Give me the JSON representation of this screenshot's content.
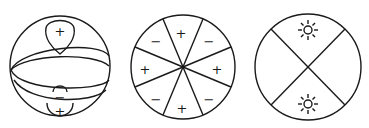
{
  "figure": {
    "panels": [
      {
        "id": "sphere",
        "description": "Sphere with a horizontal equatorial band and lobes at the poles",
        "labels": {
          "top_lobe": "+",
          "bottom_inner_lobe": "−",
          "bottom_outer_lobe": "+"
        }
      },
      {
        "id": "octants",
        "description": "Circle divided into 8 sectors with alternating signs",
        "sector_labels": [
          "+",
          "−",
          "+",
          "−",
          "+",
          "−",
          "+",
          "−"
        ]
      },
      {
        "id": "quadrants",
        "description": "Circle divided by an X into 4 quadrants, with sun symbols in top and bottom",
        "icons": [
          "sun-icon",
          "sun-icon"
        ]
      }
    ],
    "colors": {
      "line": "#1a1a1a",
      "background": "#ffffff"
    }
  }
}
